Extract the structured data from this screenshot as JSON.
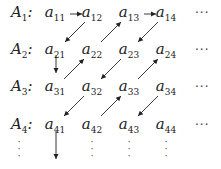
{
  "rows": [
    {
      "label_base": "A",
      "label_sub": "1",
      "colon": ":",
      "entries": [
        {
          "base": "a",
          "sub": "11"
        },
        {
          "base": "a",
          "sub": "12"
        },
        {
          "base": "a",
          "sub": "13"
        },
        {
          "base": "a",
          "sub": "14"
        }
      ],
      "trailing": "···"
    },
    {
      "label_base": "A",
      "label_sub": "2",
      "colon": ":",
      "entries": [
        {
          "base": "a",
          "sub": "21"
        },
        {
          "base": "a",
          "sub": "22"
        },
        {
          "base": "a",
          "sub": "23"
        },
        {
          "base": "a",
          "sub": "24"
        }
      ],
      "trailing": "···"
    },
    {
      "label_base": "A",
      "label_sub": "3",
      "colon": ":",
      "entries": [
        {
          "base": "a",
          "sub": "31"
        },
        {
          "base": "a",
          "sub": "32"
        },
        {
          "base": "a",
          "sub": "33"
        },
        {
          "base": "a",
          "sub": "34"
        }
      ],
      "trailing": "···"
    },
    {
      "label_base": "A",
      "label_sub": "4",
      "colon": ":",
      "entries": [
        {
          "base": "a",
          "sub": "41"
        },
        {
          "base": "a",
          "sub": "42"
        },
        {
          "base": "a",
          "sub": "43"
        },
        {
          "base": "a",
          "sub": "44"
        }
      ],
      "trailing": "···"
    }
  ],
  "vertical_ellipsis": "⋮",
  "arrows": [
    {
      "from": "a11",
      "to": "a12",
      "direction": "right"
    },
    {
      "from": "a12",
      "to": "a21",
      "direction": "down-left"
    },
    {
      "from": "a22",
      "to": "a13",
      "direction": "up-right"
    },
    {
      "from": "a13",
      "to": "a14",
      "direction": "right"
    },
    {
      "from": "a14",
      "to": "a23",
      "direction": "down-left"
    },
    {
      "from": "a21",
      "to": "a31",
      "direction": "down"
    },
    {
      "from": "a31",
      "to": "a22",
      "direction": "up-right"
    },
    {
      "from": "a23",
      "to": "a32",
      "direction": "down-left"
    },
    {
      "from": "a33",
      "to": "a24",
      "direction": "up-right"
    },
    {
      "from": "a32",
      "to": "a41",
      "direction": "down-left"
    },
    {
      "from": "a42",
      "to": "a33",
      "direction": "up-right"
    },
    {
      "from": "a34",
      "to": "a43",
      "direction": "down-left"
    },
    {
      "from": "a41",
      "to": "below",
      "direction": "down"
    }
  ]
}
